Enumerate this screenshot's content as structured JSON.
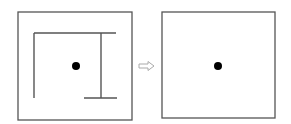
{
  "diagram": {
    "colors": {
      "stroke": "#555555",
      "dot": "#000000",
      "arrow": "#aaaaaa",
      "background": "#ffffff"
    },
    "left_panel": {
      "frame": {
        "x": 18,
        "y": 12,
        "w": 114,
        "h": 108
      },
      "walls": [
        {
          "x1": 34,
          "y1": 33,
          "x2": 34,
          "y2": 98
        },
        {
          "x1": 34,
          "y1": 33,
          "x2": 116,
          "y2": 33
        },
        {
          "x1": 101,
          "y1": 33,
          "x2": 101,
          "y2": 98
        },
        {
          "x1": 84,
          "y1": 98,
          "x2": 117,
          "y2": 98
        }
      ],
      "dot": {
        "cx": 76,
        "cy": 66,
        "r": 4
      }
    },
    "arrow": {
      "x": 139,
      "y": 66,
      "direction": "right",
      "style": "outline"
    },
    "right_panel": {
      "frame": {
        "x": 162,
        "y": 12,
        "w": 113,
        "h": 106
      },
      "dot": {
        "cx": 218,
        "cy": 66,
        "r": 4
      }
    }
  }
}
